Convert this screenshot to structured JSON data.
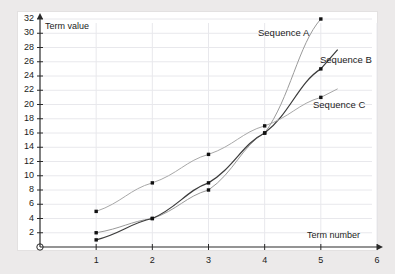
{
  "chart_data": {
    "type": "line",
    "title": "",
    "xlabel": "Term number",
    "ylabel": "Term value",
    "xlim": [
      0,
      6
    ],
    "ylim": [
      0,
      32
    ],
    "xticks": [
      "1",
      "2",
      "3",
      "4",
      "5",
      "6"
    ],
    "yticks": [
      "2",
      "4",
      "6",
      "8",
      "10",
      "12",
      "14",
      "16",
      "18",
      "20",
      "22",
      "24",
      "26",
      "28",
      "30",
      "32"
    ],
    "grid": true,
    "legend_position": "inline-right",
    "x": [
      1,
      2,
      3,
      4,
      5
    ],
    "series": [
      {
        "name": "Sequence A",
        "label": "Sequence A",
        "color": "#9a9a9a",
        "values": [
          2,
          4,
          8,
          16,
          32
        ]
      },
      {
        "name": "Sequence B",
        "label": "Sequence B",
        "color": "#3c3c3c",
        "values": [
          1,
          4,
          9,
          16,
          25
        ]
      },
      {
        "name": "Sequence C",
        "label": "Sequence C",
        "color": "#a8a8a8",
        "values": [
          5,
          9,
          13,
          17,
          21
        ]
      }
    ]
  },
  "axes": {
    "y_axis_title": "Term value",
    "x_axis_title": "Term number",
    "origin_label": "0"
  },
  "labels": {
    "sequence_a": "Sequence A",
    "sequence_b": "Sequence B",
    "sequence_c": "Sequence C"
  },
  "colors": {
    "background": "#eceaea",
    "card": "#ffffff",
    "grid": "#e8e8ec",
    "axis": "#2a2a2a",
    "series_a": "#9a9a9a",
    "series_b": "#3c3c3c",
    "series_c": "#a8a8a8"
  }
}
